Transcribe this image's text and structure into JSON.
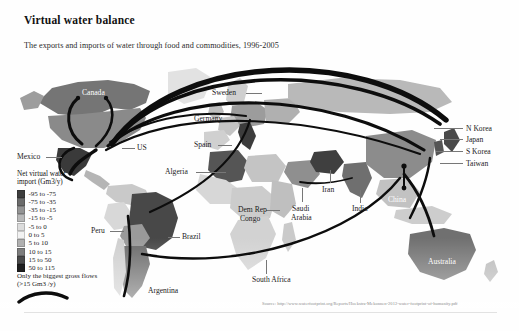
{
  "header": {
    "title": "Virtual water balance",
    "subtitle": "The exports and imports of water through food and commodities, 1996-2005"
  },
  "legend": {
    "title_line1": "Net virtual water",
    "title_line2": "import (Gm3/y)",
    "items": [
      {
        "label": "-95 to -75",
        "color": "#3d3d3d"
      },
      {
        "label": "-75 to -35",
        "color": "#6b6b6b"
      },
      {
        "label": "-35 to -15",
        "color": "#949494"
      },
      {
        "label": "-15 to -5",
        "color": "#b8b8b8"
      },
      {
        "label": "-5 to 0",
        "color": "#dcdcdc"
      },
      {
        "label": "0 to 5",
        "color": "#f2f2f2"
      },
      {
        "label": "5 to 10",
        "color": "#b0b0b0"
      },
      {
        "label": "10 to 15",
        "color": "#7d7d7d"
      },
      {
        "label": "15 to 50",
        "color": "#4a4a4a"
      },
      {
        "label": "50 to 115",
        "color": "#1f1f1f"
      }
    ],
    "flows_note_line1": "Only the biggest gross flows",
    "flows_note_line2": "(>15 Gm3 /y)"
  },
  "map": {
    "labels": [
      {
        "name": "canada",
        "text": "Canada",
        "x": 82,
        "y": 31,
        "style": "white"
      },
      {
        "name": "mexico",
        "text": "Mexico",
        "x": 17,
        "y": 95,
        "style": "dark"
      },
      {
        "name": "us",
        "text": "US",
        "x": 137,
        "y": 86,
        "style": "dark"
      },
      {
        "name": "peru",
        "text": "Peru",
        "x": 91,
        "y": 169,
        "style": "dark"
      },
      {
        "name": "brazil",
        "text": "Brazil",
        "x": 182,
        "y": 175,
        "style": "dark"
      },
      {
        "name": "argentina",
        "text": "Argentina",
        "x": 148,
        "y": 229,
        "style": "dark"
      },
      {
        "name": "sweden",
        "text": "Sweden",
        "x": 212,
        "y": 31,
        "style": "dark"
      },
      {
        "name": "germany",
        "text": "Germany",
        "x": 194,
        "y": 57,
        "style": "dark"
      },
      {
        "name": "spain",
        "text": "Spain",
        "x": 194,
        "y": 83,
        "style": "dark"
      },
      {
        "name": "algeria",
        "text": "Algeria",
        "x": 165,
        "y": 110,
        "style": "dark"
      },
      {
        "name": "iran",
        "text": "Iran",
        "x": 322,
        "y": 128,
        "style": "dark"
      },
      {
        "name": "saudi-arabia",
        "text": "Saudi",
        "x": 292,
        "y": 147,
        "style": "dark"
      },
      {
        "name": "saudi-arabia-2",
        "text": "Arabia",
        "x": 291,
        "y": 156,
        "style": "dark"
      },
      {
        "name": "india",
        "text": "India",
        "x": 352,
        "y": 147,
        "style": "dark"
      },
      {
        "name": "dem-rep-congo",
        "text": "Dem Rep",
        "x": 238,
        "y": 148,
        "style": "dark"
      },
      {
        "name": "dem-rep-congo-2",
        "text": "Congo",
        "x": 240,
        "y": 157,
        "style": "dark"
      },
      {
        "name": "south-africa",
        "text": "South Africa",
        "x": 252,
        "y": 218,
        "style": "dark"
      },
      {
        "name": "china",
        "text": "China",
        "x": 388,
        "y": 138,
        "style": "white"
      },
      {
        "name": "australia",
        "text": "Australia",
        "x": 428,
        "y": 200,
        "style": "white"
      },
      {
        "name": "n-korea",
        "text": "N Korea",
        "x": 466,
        "y": 67,
        "style": "dark"
      },
      {
        "name": "japan",
        "text": "Japan",
        "x": 466,
        "y": 78,
        "style": "dark"
      },
      {
        "name": "s-korea",
        "text": "S Korea",
        "x": 466,
        "y": 90,
        "style": "dark"
      },
      {
        "name": "taiwan",
        "text": "Taiwan",
        "x": 466,
        "y": 102,
        "style": "dark"
      }
    ]
  },
  "source": {
    "text": "Source: http://www.waterfootprint.org/Reports/Hoekstra-Mekonnen-2012-water-footprint-of-humanity.pdf"
  },
  "chart_data": {
    "type": "map",
    "title": "Virtual water balance",
    "subtitle": "The exports and imports of water through food and commodities, 1996-2005",
    "measure": "Net virtual water import (Gm3/y)",
    "scale_bins": [
      "-95 to -75",
      "-75 to -35",
      "-35 to -15",
      "-15 to -5",
      "-5 to 0",
      "0 to 5",
      "5 to 10",
      "10 to 15",
      "15 to 50",
      "50 to 115"
    ],
    "flow_threshold": "Only the biggest gross flows (>15 Gm3 /y)",
    "net_exporters_highlighted": [
      "US",
      "Canada",
      "Brazil",
      "Argentina",
      "Australia",
      "India"
    ],
    "net_importers_highlighted": [
      "Mexico",
      "Germany",
      "Spain",
      "Algeria",
      "Iran",
      "Saudi Arabia",
      "China",
      "Japan",
      "N Korea",
      "S Korea",
      "Taiwan",
      "Sweden"
    ],
    "gross_flows": [
      {
        "from": "US",
        "to": "Japan"
      },
      {
        "from": "US",
        "to": "China"
      },
      {
        "from": "US",
        "to": "Mexico"
      },
      {
        "from": "US",
        "to": "Germany"
      },
      {
        "from": "Brazil",
        "to": "Europe"
      },
      {
        "from": "Argentina",
        "to": "China"
      },
      {
        "from": "Australia",
        "to": "China"
      },
      {
        "from": "Canada",
        "to": "US"
      }
    ]
  }
}
